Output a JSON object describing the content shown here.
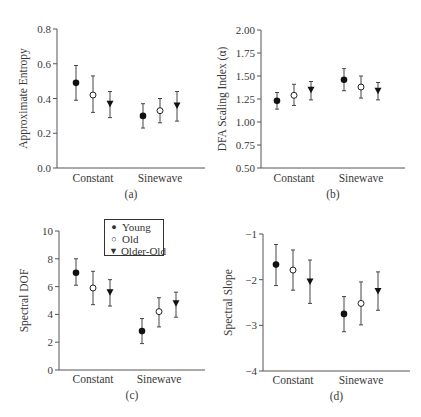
{
  "legend": {
    "items": [
      {
        "label": "Young",
        "marker": "filled-circle",
        "glyph": "●"
      },
      {
        "label": "Old",
        "marker": "open-circle",
        "glyph": "○"
      },
      {
        "label": "Older-Old",
        "marker": "filled-down-triangle",
        "glyph": "▼"
      }
    ]
  },
  "chart_data": [
    {
      "panel": "(a)",
      "type": "scatter",
      "subtype": "error-bar",
      "title": "",
      "xlabel": "",
      "ylabel": "Approximate Entropy",
      "categories": [
        "Constant",
        "Sinewave"
      ],
      "ylim": [
        0.0,
        0.8
      ],
      "yticks": [
        0.0,
        0.2,
        0.4,
        0.6,
        0.8
      ],
      "ytick_labels": [
        "0.0",
        "0.2",
        "0.4",
        "0.6",
        "0.8"
      ],
      "grid": false,
      "series": [
        {
          "name": "Young",
          "values": [
            0.49,
            0.3
          ],
          "lower": [
            0.39,
            0.23
          ],
          "upper": [
            0.59,
            0.37
          ]
        },
        {
          "name": "Old",
          "values": [
            0.42,
            0.33
          ],
          "lower": [
            0.32,
            0.26
          ],
          "upper": [
            0.53,
            0.4
          ]
        },
        {
          "name": "Older-Old",
          "values": [
            0.37,
            0.36
          ],
          "lower": [
            0.29,
            0.27
          ],
          "upper": [
            0.44,
            0.44
          ]
        }
      ]
    },
    {
      "panel": "(b)",
      "type": "scatter",
      "subtype": "error-bar",
      "title": "",
      "xlabel": "",
      "ylabel": "DFA Scaling Index (α)",
      "categories": [
        "Constant",
        "Sinewave"
      ],
      "ylim": [
        0.5,
        2.0
      ],
      "yticks": [
        0.5,
        0.75,
        1.0,
        1.25,
        1.5,
        1.75,
        2.0
      ],
      "ytick_labels": [
        "0.50",
        "0.75",
        "1.00",
        "1.25",
        "1.50",
        "1.75",
        "2.00"
      ],
      "grid": false,
      "series": [
        {
          "name": "Young",
          "values": [
            1.23,
            1.46
          ],
          "lower": [
            1.14,
            1.34
          ],
          "upper": [
            1.32,
            1.58
          ]
        },
        {
          "name": "Old",
          "values": [
            1.29,
            1.38
          ],
          "lower": [
            1.18,
            1.26
          ],
          "upper": [
            1.41,
            1.5
          ]
        },
        {
          "name": "Older-Old",
          "values": [
            1.35,
            1.34
          ],
          "lower": [
            1.24,
            1.24
          ],
          "upper": [
            1.44,
            1.43
          ]
        }
      ]
    },
    {
      "panel": "(c)",
      "type": "scatter",
      "subtype": "error-bar",
      "title": "",
      "xlabel": "",
      "ylabel": "Spectral DOF",
      "categories": [
        "Constant",
        "Sinewave"
      ],
      "ylim": [
        0,
        10
      ],
      "yticks": [
        0,
        2,
        4,
        6,
        8,
        10
      ],
      "ytick_labels": [
        "0",
        "2",
        "4",
        "6",
        "8",
        "10"
      ],
      "grid": false,
      "legend_position": "upper center",
      "series": [
        {
          "name": "Young",
          "values": [
            7.0,
            2.8
          ],
          "lower": [
            6.1,
            1.9
          ],
          "upper": [
            8.0,
            3.7
          ]
        },
        {
          "name": "Old",
          "values": [
            5.9,
            4.2
          ],
          "lower": [
            4.7,
            3.1
          ],
          "upper": [
            7.1,
            5.2
          ]
        },
        {
          "name": "Older-Old",
          "values": [
            5.6,
            4.8
          ],
          "lower": [
            4.6,
            3.8
          ],
          "upper": [
            6.5,
            5.6
          ]
        }
      ]
    },
    {
      "panel": "(d)",
      "type": "scatter",
      "subtype": "error-bar",
      "title": "",
      "xlabel": "",
      "ylabel": "Spectral Slope",
      "categories": [
        "Constant",
        "Sinewave"
      ],
      "ylim": [
        -4,
        -1
      ],
      "yticks": [
        -4,
        -3,
        -2,
        -1
      ],
      "ytick_labels": [
        "−4",
        "−3",
        "−2",
        "−1"
      ],
      "grid": false,
      "series": [
        {
          "name": "Young",
          "values": [
            -1.67,
            -2.75
          ],
          "lower": [
            -2.13,
            -3.14
          ],
          "upper": [
            -1.23,
            -2.37
          ]
        },
        {
          "name": "Old",
          "values": [
            -1.79,
            -2.52
          ],
          "lower": [
            -2.23,
            -2.99
          ],
          "upper": [
            -1.35,
            -2.05
          ]
        },
        {
          "name": "Older-Old",
          "values": [
            -2.04,
            -2.25
          ],
          "lower": [
            -2.52,
            -2.67
          ],
          "upper": [
            -1.57,
            -1.83
          ]
        }
      ]
    }
  ]
}
